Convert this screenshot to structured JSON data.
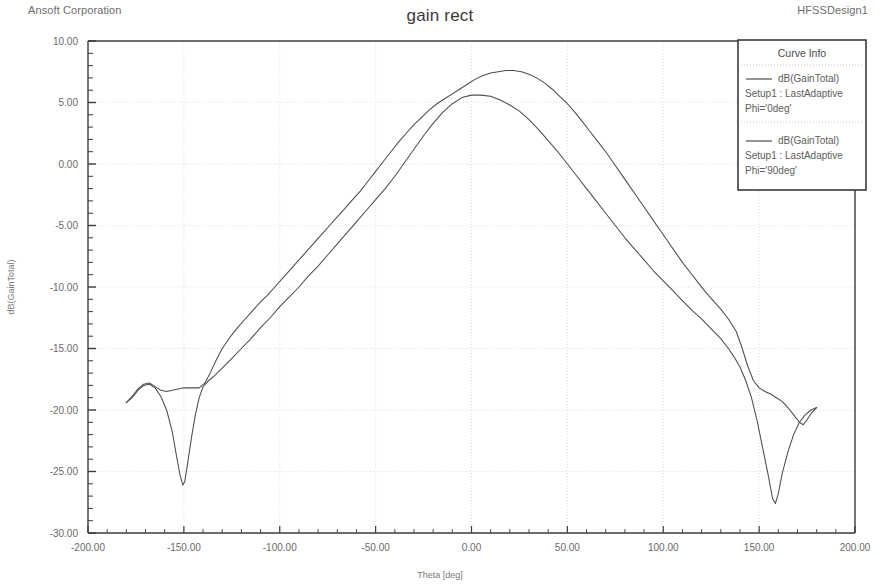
{
  "header": {
    "corporation": "Ansoft Corporation",
    "design": "HFSSDesign1",
    "title": "gain rect"
  },
  "legend": {
    "title": "Curve Info",
    "entries": [
      {
        "name": "dB(GainTotal)",
        "setup": "Setup1 : LastAdaptive",
        "condition": "Phi='0deg'",
        "color": "#4d4d4d"
      },
      {
        "name": "dB(GainTotal)",
        "setup": "Setup1 : LastAdaptive",
        "condition": "Phi='90deg'",
        "color": "#4d4d4d"
      }
    ]
  },
  "chart_data": {
    "type": "line",
    "title": "gain rect",
    "xlabel": "Theta [deg]",
    "ylabel": "dB(GainTotal)",
    "xlim": [
      -200,
      200
    ],
    "ylim": [
      -30,
      10
    ],
    "xticks": [
      -200,
      -150,
      -100,
      -50,
      0,
      50,
      100,
      150,
      200
    ],
    "xticklabels": [
      "-200.00",
      "-150.00",
      "-100.00",
      "-50.00",
      "0.00",
      "50.00",
      "100.00",
      "150.00",
      "200.00"
    ],
    "yticks": [
      10,
      5,
      0,
      -5,
      -10,
      -15,
      -20,
      -25,
      -30
    ],
    "yticklabels": [
      "10.00",
      "5.00",
      "0.00",
      "-5.00",
      "-10.00",
      "-15.00",
      "-20.00",
      "-25.00",
      "-30.00"
    ],
    "x_minor_per_major": 5,
    "y_minor_per_major": 5,
    "grid": true,
    "legend_position": "top-right",
    "series": [
      {
        "name": "dB(GainTotal) Setup1 : LastAdaptive Phi='0deg'",
        "color": "#4d4d4d",
        "points": [
          [
            -180,
            -19.4
          ],
          [
            -177,
            -19.0
          ],
          [
            -174,
            -18.4
          ],
          [
            -171,
            -18.0
          ],
          [
            -168,
            -17.9
          ],
          [
            -165,
            -18.2
          ],
          [
            -162,
            -18.9
          ],
          [
            -159,
            -20.0
          ],
          [
            -156,
            -21.8
          ],
          [
            -154,
            -23.6
          ],
          [
            -152,
            -25.3
          ],
          [
            -150.5,
            -26.1
          ],
          [
            -149.5,
            -25.8
          ],
          [
            -148,
            -24.3
          ],
          [
            -146,
            -22.2
          ],
          [
            -144,
            -20.4
          ],
          [
            -142,
            -19.0
          ],
          [
            -140,
            -18.1
          ],
          [
            -137,
            -17.6
          ],
          [
            -134,
            -17.2
          ],
          [
            -130,
            -16.6
          ],
          [
            -125,
            -15.8
          ],
          [
            -120,
            -15.0
          ],
          [
            -115,
            -14.2
          ],
          [
            -110,
            -13.3
          ],
          [
            -105,
            -12.5
          ],
          [
            -100,
            -11.6
          ],
          [
            -95,
            -10.8
          ],
          [
            -90,
            -10.0
          ],
          [
            -85,
            -9.1
          ],
          [
            -80,
            -8.3
          ],
          [
            -75,
            -7.4
          ],
          [
            -70,
            -6.5
          ],
          [
            -65,
            -5.6
          ],
          [
            -60,
            -4.7
          ],
          [
            -55,
            -3.8
          ],
          [
            -50,
            -2.9
          ],
          [
            -45,
            -2.0
          ],
          [
            -40,
            -1.0
          ],
          [
            -35,
            0.1
          ],
          [
            -30,
            1.2
          ],
          [
            -25,
            2.3
          ],
          [
            -20,
            3.3
          ],
          [
            -15,
            4.2
          ],
          [
            -10,
            4.9
          ],
          [
            -5,
            5.4
          ],
          [
            0,
            5.6
          ],
          [
            5,
            5.6
          ],
          [
            10,
            5.5
          ],
          [
            15,
            5.2
          ],
          [
            20,
            4.8
          ],
          [
            25,
            4.3
          ],
          [
            30,
            3.6
          ],
          [
            35,
            2.8
          ],
          [
            40,
            1.9
          ],
          [
            45,
            1.0
          ],
          [
            50,
            0.0
          ],
          [
            55,
            -1.0
          ],
          [
            60,
            -2.0
          ],
          [
            65,
            -3.0
          ],
          [
            70,
            -4.0
          ],
          [
            75,
            -5.0
          ],
          [
            80,
            -6.0
          ],
          [
            85,
            -6.9
          ],
          [
            90,
            -7.8
          ],
          [
            95,
            -8.7
          ],
          [
            100,
            -9.5
          ],
          [
            105,
            -10.3
          ],
          [
            110,
            -11.1
          ],
          [
            115,
            -11.9
          ],
          [
            120,
            -12.6
          ],
          [
            125,
            -13.4
          ],
          [
            130,
            -14.2
          ],
          [
            134,
            -15.0
          ],
          [
            137,
            -15.7
          ],
          [
            140,
            -16.5
          ],
          [
            143,
            -17.6
          ],
          [
            146,
            -19.0
          ],
          [
            149,
            -20.9
          ],
          [
            152,
            -23.2
          ],
          [
            155,
            -25.5
          ],
          [
            157,
            -27.2
          ],
          [
            158.5,
            -27.6
          ],
          [
            160,
            -26.8
          ],
          [
            162,
            -25.2
          ],
          [
            165,
            -23.4
          ],
          [
            168,
            -22.0
          ],
          [
            171,
            -21.0
          ],
          [
            174,
            -20.4
          ],
          [
            177,
            -20.0
          ],
          [
            180,
            -19.8
          ]
        ]
      },
      {
        "name": "dB(GainTotal) Setup1 : LastAdaptive Phi='90deg'",
        "color": "#4d4d4d",
        "points": [
          [
            -180,
            -19.4
          ],
          [
            -177,
            -18.9
          ],
          [
            -174,
            -18.3
          ],
          [
            -171,
            -17.9
          ],
          [
            -168,
            -17.8
          ],
          [
            -165,
            -18.1
          ],
          [
            -162,
            -18.4
          ],
          [
            -159,
            -18.5
          ],
          [
            -156,
            -18.4
          ],
          [
            -153,
            -18.3
          ],
          [
            -150,
            -18.2
          ],
          [
            -146,
            -18.2
          ],
          [
            -142,
            -18.2
          ],
          [
            -139,
            -17.8
          ],
          [
            -136,
            -16.9
          ],
          [
            -133,
            -15.9
          ],
          [
            -130,
            -15.0
          ],
          [
            -126,
            -14.1
          ],
          [
            -122,
            -13.3
          ],
          [
            -118,
            -12.6
          ],
          [
            -114,
            -11.9
          ],
          [
            -110,
            -11.2
          ],
          [
            -106,
            -10.6
          ],
          [
            -102,
            -9.9
          ],
          [
            -98,
            -9.2
          ],
          [
            -94,
            -8.5
          ],
          [
            -90,
            -7.8
          ],
          [
            -86,
            -7.1
          ],
          [
            -82,
            -6.4
          ],
          [
            -78,
            -5.7
          ],
          [
            -74,
            -5.0
          ],
          [
            -70,
            -4.3
          ],
          [
            -66,
            -3.6
          ],
          [
            -62,
            -2.9
          ],
          [
            -58,
            -2.2
          ],
          [
            -54,
            -1.4
          ],
          [
            -50,
            -0.6
          ],
          [
            -46,
            0.2
          ],
          [
            -42,
            1.0
          ],
          [
            -38,
            1.8
          ],
          [
            -34,
            2.5
          ],
          [
            -30,
            3.2
          ],
          [
            -26,
            3.8
          ],
          [
            -22,
            4.4
          ],
          [
            -18,
            4.9
          ],
          [
            -14,
            5.3
          ],
          [
            -10,
            5.7
          ],
          [
            -6,
            6.1
          ],
          [
            -2,
            6.5
          ],
          [
            2,
            6.9
          ],
          [
            6,
            7.2
          ],
          [
            10,
            7.4
          ],
          [
            14,
            7.5
          ],
          [
            18,
            7.6
          ],
          [
            22,
            7.6
          ],
          [
            26,
            7.5
          ],
          [
            30,
            7.3
          ],
          [
            34,
            7.0
          ],
          [
            38,
            6.6
          ],
          [
            42,
            6.1
          ],
          [
            46,
            5.5
          ],
          [
            50,
            4.9
          ],
          [
            54,
            4.2
          ],
          [
            58,
            3.4
          ],
          [
            62,
            2.6
          ],
          [
            66,
            1.8
          ],
          [
            70,
            1.0
          ],
          [
            74,
            0.1
          ],
          [
            78,
            -0.8
          ],
          [
            82,
            -1.7
          ],
          [
            86,
            -2.6
          ],
          [
            90,
            -3.5
          ],
          [
            94,
            -4.4
          ],
          [
            98,
            -5.3
          ],
          [
            102,
            -6.2
          ],
          [
            106,
            -7.1
          ],
          [
            110,
            -8.0
          ],
          [
            114,
            -8.8
          ],
          [
            118,
            -9.6
          ],
          [
            122,
            -10.4
          ],
          [
            126,
            -11.1
          ],
          [
            130,
            -11.8
          ],
          [
            134,
            -12.6
          ],
          [
            138,
            -13.6
          ],
          [
            141,
            -14.9
          ],
          [
            144,
            -16.4
          ],
          [
            147,
            -17.6
          ],
          [
            150,
            -18.2
          ],
          [
            153,
            -18.5
          ],
          [
            156,
            -18.7
          ],
          [
            159,
            -19.0
          ],
          [
            162,
            -19.3
          ],
          [
            165,
            -19.8
          ],
          [
            168,
            -20.4
          ],
          [
            171,
            -21.0
          ],
          [
            173,
            -21.2
          ],
          [
            175,
            -20.8
          ],
          [
            177,
            -20.3
          ],
          [
            180,
            -19.8
          ]
        ]
      }
    ]
  }
}
